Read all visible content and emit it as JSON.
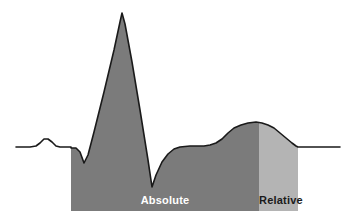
{
  "figure": {
    "background_color": "#ffffff",
    "trace_color": "#1a1a1a",
    "trace_width": 1.6
  },
  "regions": [
    {
      "id": "absolute",
      "label": "Absolute",
      "fill_color": "#7b7b7b",
      "text_color": "#ffffff",
      "x_start": 71,
      "x_end": 259
    },
    {
      "id": "relative",
      "label": "Relative",
      "fill_color": "#b4b4b4",
      "text_color": "#1a1a1a",
      "x_start": 259,
      "x_end": 298
    }
  ],
  "chart_data": {
    "type": "line",
    "title": "",
    "xlabel": "",
    "ylabel": "",
    "grid": false,
    "legend": "none",
    "xlim": [
      0,
      352
    ],
    "ylim": [
      222,
      0
    ],
    "annotations": [
      {
        "text": "Absolute",
        "x": 152,
        "y": 204
      },
      {
        "text": "Relative",
        "x": 278,
        "y": 204
      }
    ],
    "series": [
      {
        "name": "ECG trace",
        "color": "#1a1a1a",
        "points": [
          [
            16,
            147
          ],
          [
            30,
            147
          ],
          [
            36,
            146
          ],
          [
            40,
            143
          ],
          [
            44,
            139
          ],
          [
            48,
            139
          ],
          [
            52,
            142
          ],
          [
            56,
            146
          ],
          [
            60,
            147
          ],
          [
            71,
            147
          ],
          [
            71,
            148
          ],
          [
            76,
            148
          ],
          [
            80,
            152
          ],
          [
            84,
            163
          ],
          [
            88,
            155
          ],
          [
            94,
            132
          ],
          [
            104,
            92
          ],
          [
            114,
            50
          ],
          [
            120,
            22
          ],
          [
            122,
            13
          ],
          [
            125,
            24
          ],
          [
            132,
            62
          ],
          [
            140,
            110
          ],
          [
            148,
            160
          ],
          [
            152,
            187
          ],
          [
            156,
            175
          ],
          [
            162,
            162
          ],
          [
            168,
            154
          ],
          [
            174,
            149
          ],
          [
            180,
            147
          ],
          [
            190,
            146
          ],
          [
            204,
            146
          ],
          [
            210,
            145
          ],
          [
            216,
            143
          ],
          [
            222,
            139
          ],
          [
            228,
            133
          ],
          [
            234,
            128
          ],
          [
            241,
            125
          ],
          [
            248,
            123
          ],
          [
            256,
            122
          ],
          [
            262,
            123
          ],
          [
            268,
            125
          ],
          [
            274,
            128
          ],
          [
            280,
            133
          ],
          [
            286,
            138
          ],
          [
            292,
            143
          ],
          [
            296,
            146
          ],
          [
            298,
            147
          ],
          [
            312,
            147
          ],
          [
            340,
            147
          ]
        ]
      }
    ],
    "baseline_y": 147,
    "fill_bottom_y": 211
  }
}
